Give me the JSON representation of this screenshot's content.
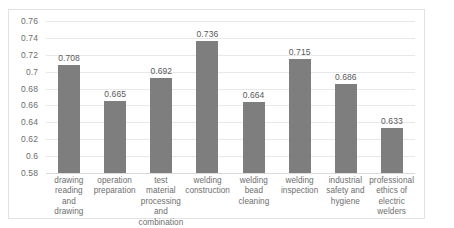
{
  "chart_data": {
    "type": "bar",
    "title": "",
    "subtitle": "",
    "xlabel": "",
    "ylabel": "",
    "ylim": [
      0.58,
      0.76
    ],
    "ytick_step": 0.02,
    "yticks": [
      "0.76",
      "0.74",
      "0.72",
      "0.7",
      "0.68",
      "0.66",
      "0.64",
      "0.62",
      "0.6",
      "0.58"
    ],
    "grid": true,
    "legend": "none",
    "bar_color": "#7e7e7e",
    "gridline_color": "#e8e8e8",
    "categories": [
      "drawing reading and drawing",
      "operation preparation",
      "test material processing and combination",
      "welding construction",
      "welding bead cleaning",
      "welding inspection",
      "industrial safety and hygiene",
      "professional ethics of electric welders"
    ],
    "values": [
      0.708,
      0.665,
      0.692,
      0.736,
      0.664,
      0.715,
      0.686,
      0.633
    ],
    "data_labels": [
      "0.708",
      "0.665",
      "0.692",
      "0.736",
      "0.664",
      "0.715",
      "0.686",
      "0.633"
    ]
  }
}
